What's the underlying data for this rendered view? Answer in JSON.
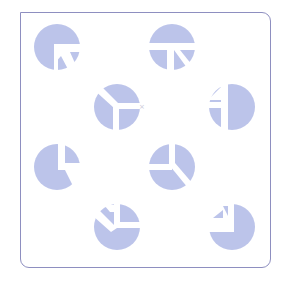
{
  "puzzle": {
    "type": "figure-matrix",
    "frame": {
      "border_color": "#8e8fc0",
      "background": "#ffffff"
    },
    "piece_color": "#bcc4ea",
    "cut_color": "#ffffff",
    "piece_radius": 23,
    "pieces": [
      {
        "id": 1,
        "cx": 57,
        "cy": 47,
        "glyph": "arrow-up-left-cut"
      },
      {
        "id": 2,
        "cx": 172,
        "cy": 47,
        "glyph": "t-diagonal-cut"
      },
      {
        "id": 3,
        "cx": 117,
        "cy": 107,
        "glyph": "y-split-cut"
      },
      {
        "id": 4,
        "cx": 232,
        "cy": 107,
        "glyph": "bar-triangle-cut"
      },
      {
        "id": 5,
        "cx": 57,
        "cy": 167,
        "glyph": "vertical-horizontal-cut"
      },
      {
        "id": 6,
        "cx": 172,
        "cy": 167,
        "glyph": "three-wedge-cut"
      },
      {
        "id": 7,
        "cx": 117,
        "cy": 227,
        "glyph": "angle-cut"
      },
      {
        "id": 8,
        "cx": 232,
        "cy": 227,
        "glyph": "notch-cut"
      }
    ]
  }
}
